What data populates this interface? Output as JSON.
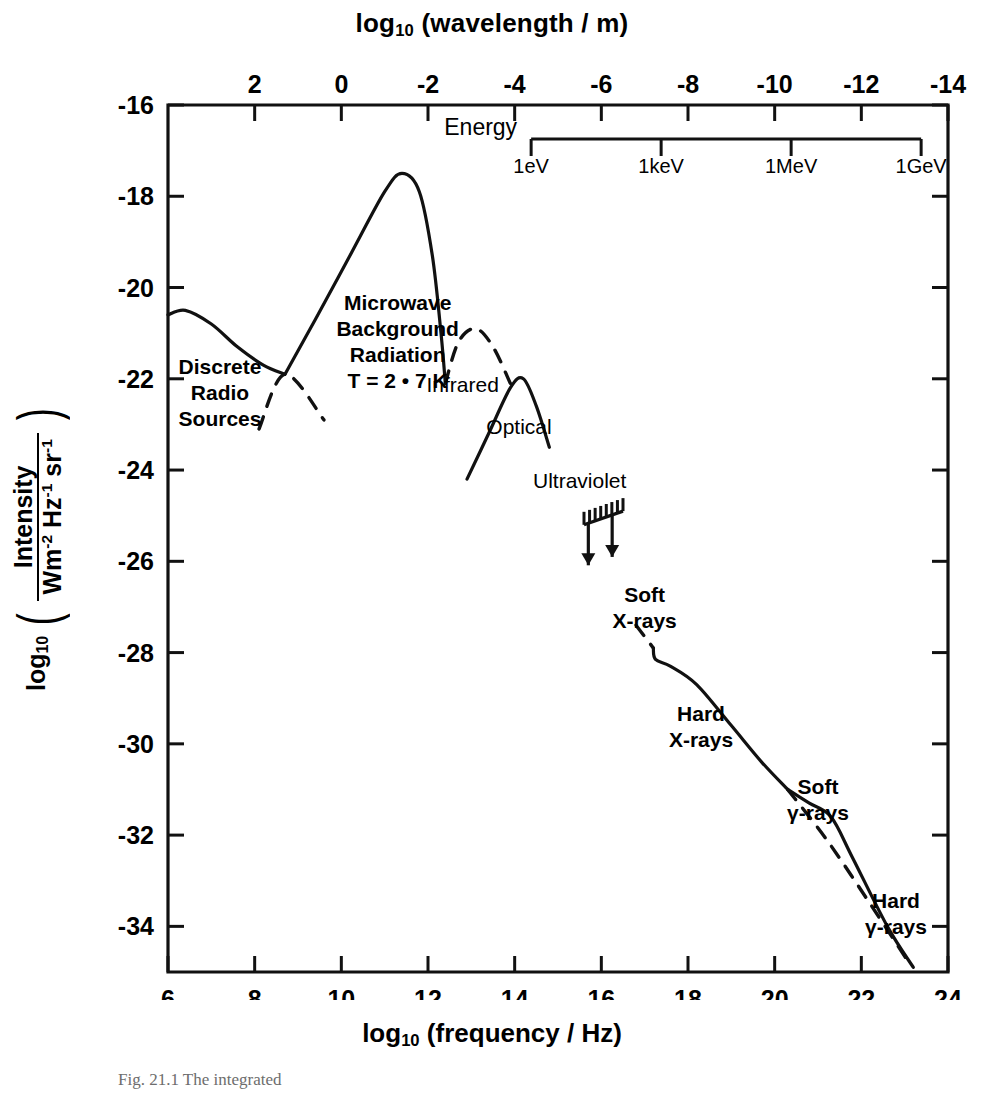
{
  "figure": {
    "caption": "Fig. 21.1  The integrated",
    "top_axis_title_pre": "log",
    "top_axis_title_sub": "10",
    "top_axis_title_post": " (wavelength / m)",
    "bottom_axis_title_pre": "log",
    "bottom_axis_title_sub": "10",
    "bottom_axis_title_post": " (frequency / Hz)",
    "y_axis_title_pre": "log",
    "y_axis_title_sub": "10",
    "y_axis_numerator": "Intensity",
    "y_axis_denominator": "Wm",
    "y_axis_den_sup1": "-2",
    "y_axis_den_mid": " Hz",
    "y_axis_den_sup2": "-1",
    "y_axis_den_end": " sr",
    "y_axis_den_sup3": "-1"
  },
  "chart_data": {
    "type": "line",
    "xlabel": "log10 (frequency / Hz)",
    "ylabel": "log10 (Intensity / Wm-2 Hz-1 sr-1)",
    "xlim": [
      6,
      24
    ],
    "ylim": [
      -35,
      -16
    ],
    "grid": false,
    "legend": "none",
    "x_ticks": [
      6,
      8,
      10,
      12,
      14,
      16,
      18,
      20,
      22,
      24
    ],
    "x_tick_labels": [
      "6",
      "8",
      "10",
      "12",
      "14",
      "16",
      "18",
      "20",
      "22",
      "24"
    ],
    "y_ticks": [
      -16,
      -18,
      -20,
      -22,
      -24,
      -26,
      -28,
      -30,
      -32,
      -34
    ],
    "y_tick_labels": [
      "-16",
      "-18",
      "-20",
      "-22",
      "-24",
      "-26",
      "-28",
      "-30",
      "-32",
      "-34"
    ],
    "top_axis": {
      "label": "log10 (wavelength / m)",
      "ticks": [
        2,
        0,
        -2,
        -4,
        -6,
        -8,
        -10,
        -12,
        -14
      ],
      "tick_labels": [
        "2",
        "0",
        "-2",
        "-4",
        "-6",
        "-8",
        "-10",
        "-12",
        "-14"
      ],
      "relation": "lambda = c / nu"
    },
    "energy_axis": {
      "label": "Energy",
      "ticks": [
        "1eV",
        "1keV",
        "1MeV",
        "1GeV"
      ],
      "tick_frequencies_log10": [
        14.38,
        17.38,
        20.38,
        23.38
      ]
    },
    "annotations": [
      {
        "label": "Discrete\nRadio\nSources",
        "lines": [
          "Discrete",
          "Radio",
          "Sources"
        ],
        "x_log": 7.2,
        "y_log": -21.9
      },
      {
        "label": "Microwave\nBackground\nRadiation\nT = 2 • 7 K",
        "lines": [
          "Microwave",
          "Background",
          "Radiation",
          "T = 2 • 7 K"
        ],
        "x_log": 11.3,
        "y_log": -20.5
      },
      {
        "label": "Infrared",
        "lines": [
          "Infrared"
        ],
        "x_log": 12.8,
        "y_log": -22.3
      },
      {
        "label": "Optical",
        "lines": [
          "Optical"
        ],
        "x_log": 14.1,
        "y_log": -23.2
      },
      {
        "label": "Ultraviolet",
        "lines": [
          "Ultraviolet"
        ],
        "x_log": 15.5,
        "y_log": -24.4
      },
      {
        "label": "Soft\nX-rays",
        "lines": [
          "Soft",
          "X-rays"
        ],
        "x_log": 17.0,
        "y_log": -26.9
      },
      {
        "label": "Hard\nX-rays",
        "lines": [
          "Hard",
          "X-rays"
        ],
        "x_log": 18.3,
        "y_log": -29.5
      },
      {
        "label": "Soft\nγ-rays",
        "lines": [
          "Soft",
          "γ-rays"
        ],
        "x_log": 21.0,
        "y_log": -31.1
      },
      {
        "label": "Hard\nγ-rays",
        "lines": [
          "Hard",
          "γ-rays"
        ],
        "x_log": 22.8,
        "y_log": -33.6
      }
    ],
    "series": [
      {
        "name": "Discrete Radio Sources",
        "style": "solid",
        "points": [
          [
            6.0,
            -20.6
          ],
          [
            6.4,
            -20.5
          ],
          [
            7.0,
            -20.8
          ],
          [
            7.6,
            -21.3
          ],
          [
            8.2,
            -21.7
          ],
          [
            8.7,
            -21.9
          ]
        ]
      },
      {
        "name": "Radio extrapolation (dashed)",
        "style": "dashed",
        "points": [
          [
            8.1,
            -23.1
          ],
          [
            8.7,
            -21.9
          ],
          [
            9.6,
            -22.9
          ]
        ]
      },
      {
        "name": "Microwave Background Radiation T = 2.7 K",
        "style": "solid",
        "points": [
          [
            8.7,
            -21.9
          ],
          [
            9.4,
            -20.7
          ],
          [
            10.2,
            -19.3
          ],
          [
            11.0,
            -17.9
          ],
          [
            11.4,
            -17.5
          ],
          [
            11.8,
            -17.9
          ],
          [
            12.1,
            -19.3
          ],
          [
            12.3,
            -21.0
          ],
          [
            12.4,
            -22.1
          ]
        ]
      },
      {
        "name": "Infrared",
        "style": "dashed",
        "points": [
          [
            12.4,
            -22.1
          ],
          [
            12.7,
            -21.2
          ],
          [
            13.1,
            -20.9
          ],
          [
            13.5,
            -21.3
          ],
          [
            13.9,
            -22.1
          ]
        ]
      },
      {
        "name": "Optical",
        "style": "solid",
        "points": [
          [
            12.9,
            -24.2
          ],
          [
            13.4,
            -23.2
          ],
          [
            13.9,
            -22.2
          ],
          [
            14.2,
            -22.0
          ],
          [
            14.5,
            -22.6
          ],
          [
            14.8,
            -23.5
          ]
        ]
      },
      {
        "name": "Ultraviolet upper limits",
        "style": "upper-limit-bar",
        "points": [
          [
            15.6,
            -25.2
          ],
          [
            16.5,
            -24.9
          ]
        ],
        "arrows": [
          [
            15.7,
            -25.3
          ],
          [
            16.25,
            -25.2
          ]
        ]
      },
      {
        "name": "Soft X-rays (dashed)",
        "style": "dashed",
        "points": [
          [
            16.8,
            -27.4
          ],
          [
            17.2,
            -27.9
          ]
        ]
      },
      {
        "name": "Hard X-rays",
        "style": "solid",
        "points": [
          [
            17.2,
            -27.9
          ],
          [
            17.25,
            -28.15
          ],
          [
            17.6,
            -28.3
          ],
          [
            18.2,
            -28.7
          ],
          [
            19.0,
            -29.6
          ],
          [
            19.7,
            -30.4
          ],
          [
            20.3,
            -31.0
          ]
        ]
      },
      {
        "name": "Soft / Hard gamma-rays (solid)",
        "style": "solid",
        "points": [
          [
            20.3,
            -31.0
          ],
          [
            20.8,
            -31.3
          ],
          [
            21.3,
            -31.6
          ],
          [
            21.8,
            -32.5
          ],
          [
            22.6,
            -34.0
          ],
          [
            23.2,
            -34.9
          ]
        ]
      },
      {
        "name": "gamma-ray extrapolation (dashed)",
        "style": "dashed",
        "points": [
          [
            20.3,
            -31.0
          ],
          [
            21.2,
            -32.1
          ],
          [
            22.2,
            -33.5
          ],
          [
            23.1,
            -34.8
          ]
        ]
      }
    ]
  }
}
